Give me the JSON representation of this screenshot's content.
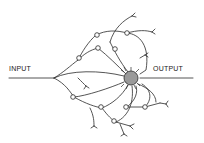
{
  "diagram": {
    "input_label": "INPUT",
    "output_label": "OUTPUT",
    "colors": {
      "line": "#2a2a2a",
      "soma_fill": "#9a9a9a",
      "background": "#ffffff"
    }
  }
}
